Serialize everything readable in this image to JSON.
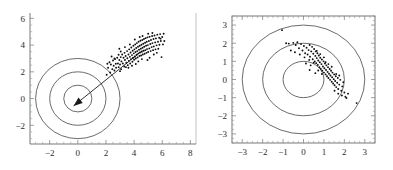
{
  "figure": {
    "title": "",
    "background": "#ffffff",
    "point_color": "#0d0d0d",
    "ring_color": "#3a3a3a",
    "axis_color": "#555555"
  },
  "chart_data": [
    {
      "type": "scatter",
      "panel": "left",
      "title": "",
      "xlabel": "",
      "ylabel": "",
      "xlim": [
        -3.4,
        8.4
      ],
      "ylim": [
        -3.4,
        6.4
      ],
      "xticks": [
        -2,
        0,
        2,
        4,
        6,
        8
      ],
      "xtick_labels": [
        "-2",
        "0",
        "2",
        "4",
        "6",
        "8"
      ],
      "yticks": [
        -2,
        0,
        2,
        4,
        6
      ],
      "ytick_labels": [
        "-2",
        "0",
        "2",
        "4",
        "6"
      ],
      "grid": false,
      "legend": null,
      "axes_style": "L-shaped spines with minor ticks",
      "annotations": [
        {
          "kind": "circle",
          "label": "unit-circle",
          "center": [
            0,
            0
          ],
          "radius": 1
        },
        {
          "kind": "circle",
          "label": "radius-2-circle",
          "center": [
            0,
            0
          ],
          "radius": 2
        },
        {
          "kind": "circle",
          "label": "radius-3-circle",
          "center": [
            0,
            0
          ],
          "radius": 3
        },
        {
          "kind": "arrow",
          "label": "mean-direction-arrow",
          "from": [
            4.6,
            3.6
          ],
          "to": [
            -0.3,
            -0.55
          ]
        }
      ],
      "points": [
        [
          2.05,
          1.78
        ],
        [
          2.15,
          2.3
        ],
        [
          2.3,
          1.95
        ],
        [
          2.35,
          2.55
        ],
        [
          2.45,
          2.2
        ],
        [
          2.5,
          2.85
        ],
        [
          2.55,
          2.45
        ],
        [
          2.6,
          2.1
        ],
        [
          2.65,
          2.95
        ],
        [
          2.7,
          2.6
        ],
        [
          2.72,
          2.3
        ],
        [
          2.8,
          3.05
        ],
        [
          2.85,
          2.62
        ],
        [
          2.9,
          2.35
        ],
        [
          2.95,
          2.88
        ],
        [
          3.0,
          2.55
        ],
        [
          3.05,
          3.1
        ],
        [
          3.08,
          2.2
        ],
        [
          3.1,
          2.78
        ],
        [
          3.15,
          3.3
        ],
        [
          3.2,
          2.62
        ],
        [
          3.25,
          3.05
        ],
        [
          3.3,
          2.4
        ],
        [
          3.32,
          3.42
        ],
        [
          3.35,
          2.88
        ],
        [
          3.4,
          3.18
        ],
        [
          3.45,
          2.68
        ],
        [
          3.5,
          3.55
        ],
        [
          3.52,
          3.02
        ],
        [
          3.55,
          2.5
        ],
        [
          3.6,
          3.3
        ],
        [
          3.62,
          2.82
        ],
        [
          3.65,
          3.68
        ],
        [
          3.7,
          3.12
        ],
        [
          3.72,
          2.62
        ],
        [
          3.75,
          3.45
        ],
        [
          3.78,
          2.95
        ],
        [
          3.8,
          3.82
        ],
        [
          3.85,
          3.25
        ],
        [
          3.88,
          2.75
        ],
        [
          3.9,
          3.58
        ],
        [
          3.92,
          3.05
        ],
        [
          3.95,
          3.95
        ],
        [
          3.98,
          3.38
        ],
        [
          4.0,
          2.9
        ],
        [
          4.02,
          3.68
        ],
        [
          4.05,
          3.15
        ],
        [
          4.08,
          4.05
        ],
        [
          4.1,
          3.48
        ],
        [
          4.12,
          3.0
        ],
        [
          4.15,
          3.78
        ],
        [
          4.18,
          3.28
        ],
        [
          4.2,
          4.15
        ],
        [
          4.22,
          3.55
        ],
        [
          4.25,
          3.08
        ],
        [
          4.28,
          3.88
        ],
        [
          4.3,
          3.38
        ],
        [
          4.32,
          4.25
        ],
        [
          4.35,
          3.65
        ],
        [
          4.38,
          3.18
        ],
        [
          4.4,
          3.95
        ],
        [
          4.42,
          3.45
        ],
        [
          4.45,
          4.32
        ],
        [
          4.48,
          3.72
        ],
        [
          4.5,
          3.22
        ],
        [
          4.52,
          4.02
        ],
        [
          4.55,
          3.5
        ],
        [
          4.58,
          4.38
        ],
        [
          4.6,
          3.8
        ],
        [
          4.62,
          3.3
        ],
        [
          4.65,
          4.1
        ],
        [
          4.68,
          3.58
        ],
        [
          4.7,
          4.45
        ],
        [
          4.72,
          3.88
        ],
        [
          4.75,
          3.35
        ],
        [
          4.78,
          4.18
        ],
        [
          4.8,
          3.62
        ],
        [
          4.82,
          4.52
        ],
        [
          4.85,
          3.95
        ],
        [
          4.88,
          3.42
        ],
        [
          4.9,
          4.25
        ],
        [
          4.92,
          3.7
        ],
        [
          4.95,
          4.58
        ],
        [
          4.98,
          4.0
        ],
        [
          5.0,
          3.48
        ],
        [
          5.05,
          4.3
        ],
        [
          5.08,
          3.75
        ],
        [
          5.1,
          4.62
        ],
        [
          5.15,
          4.08
        ],
        [
          5.18,
          3.55
        ],
        [
          5.2,
          4.38
        ],
        [
          5.25,
          3.85
        ],
        [
          5.28,
          4.68
        ],
        [
          5.3,
          4.15
        ],
        [
          5.35,
          3.62
        ],
        [
          5.38,
          4.45
        ],
        [
          5.4,
          3.9
        ],
        [
          5.45,
          4.72
        ],
        [
          5.5,
          4.2
        ],
        [
          5.52,
          3.68
        ],
        [
          5.55,
          4.5
        ],
        [
          5.6,
          3.98
        ],
        [
          5.65,
          4.78
        ],
        [
          5.7,
          4.25
        ],
        [
          5.72,
          3.72
        ],
        [
          5.78,
          4.55
        ],
        [
          5.8,
          4.02
        ],
        [
          5.85,
          4.82
        ],
        [
          5.9,
          4.3
        ],
        [
          5.95,
          3.1
        ],
        [
          6.0,
          4.6
        ],
        [
          6.05,
          4.05
        ],
        [
          6.1,
          4.85
        ],
        [
          2.25,
          2.72
        ],
        [
          2.6,
          3.0
        ],
        [
          3.0,
          2.05
        ],
        [
          3.42,
          2.35
        ],
        [
          3.05,
          3.52
        ],
        [
          4.3,
          2.78
        ],
        [
          4.55,
          2.95
        ],
        [
          5.1,
          3.05
        ],
        [
          5.4,
          3.3
        ],
        [
          4.95,
          2.88
        ],
        [
          3.85,
          2.45
        ],
        [
          2.9,
          3.28
        ],
        [
          3.6,
          2.3
        ],
        [
          4.12,
          2.58
        ],
        [
          5.62,
          3.42
        ],
        [
          5.88,
          4.48
        ],
        [
          6.15,
          4.3
        ],
        [
          4.4,
          4.6
        ],
        [
          4.05,
          4.42
        ],
        [
          3.7,
          4.05
        ],
        [
          3.35,
          3.85
        ],
        [
          2.95,
          3.72
        ],
        [
          5.0,
          4.85
        ],
        [
          5.3,
          4.9
        ],
        [
          4.6,
          4.68
        ],
        [
          2.4,
          3.15
        ],
        [
          2.1,
          2.6
        ]
      ]
    },
    {
      "type": "scatter",
      "panel": "right",
      "title": "",
      "xlabel": "",
      "ylabel": "",
      "xlim": [
        -3.5,
        3.5
      ],
      "ylim": [
        -3.5,
        3.5
      ],
      "xticks": [
        -3,
        -2,
        -1,
        0,
        1,
        2,
        3
      ],
      "xtick_labels": [
        "-3",
        "-2",
        "-1",
        "0",
        "1",
        "2",
        "3"
      ],
      "yticks": [
        -3,
        -2,
        -1,
        0,
        1,
        2,
        3
      ],
      "ytick_labels": [
        "-3",
        "-2",
        "-1",
        "0",
        "1",
        "2",
        "3"
      ],
      "grid": false,
      "legend": null,
      "axes_style": "full box frame with minor ticks",
      "annotations": [
        {
          "kind": "circle",
          "label": "unit-circle",
          "center": [
            0,
            0
          ],
          "radius": 1
        },
        {
          "kind": "circle",
          "label": "radius-2-circle",
          "center": [
            0,
            0
          ],
          "radius": 2
        },
        {
          "kind": "circle",
          "label": "radius-3-circle",
          "center": [
            0,
            0
          ],
          "radius": 3
        }
      ],
      "points": [
        [
          -1.05,
          2.72
        ],
        [
          -0.85,
          2.0
        ],
        [
          -0.72,
          1.98
        ],
        [
          -0.5,
          2.02
        ],
        [
          -0.38,
          1.9
        ],
        [
          -0.3,
          2.05
        ],
        [
          -0.22,
          1.72
        ],
        [
          -0.12,
          1.95
        ],
        [
          -0.05,
          1.6
        ],
        [
          0.02,
          1.85
        ],
        [
          0.08,
          1.45
        ],
        [
          0.15,
          1.75
        ],
        [
          0.2,
          1.38
        ],
        [
          0.25,
          1.62
        ],
        [
          0.3,
          1.9
        ],
        [
          0.32,
          1.25
        ],
        [
          0.38,
          1.55
        ],
        [
          0.42,
          1.8
        ],
        [
          0.45,
          1.12
        ],
        [
          0.48,
          1.42
        ],
        [
          0.52,
          1.68
        ],
        [
          0.55,
          1.0
        ],
        [
          0.58,
          1.3
        ],
        [
          0.6,
          1.55
        ],
        [
          0.62,
          0.9
        ],
        [
          0.65,
          1.18
        ],
        [
          0.68,
          1.45
        ],
        [
          0.7,
          0.8
        ],
        [
          0.72,
          1.05
        ],
        [
          0.75,
          1.32
        ],
        [
          0.78,
          0.68
        ],
        [
          0.8,
          0.95
        ],
        [
          0.82,
          1.2
        ],
        [
          0.85,
          0.58
        ],
        [
          0.88,
          0.85
        ],
        [
          0.9,
          1.1
        ],
        [
          0.92,
          0.48
        ],
        [
          0.95,
          0.72
        ],
        [
          0.98,
          1.0
        ],
        [
          1.0,
          0.38
        ],
        [
          1.02,
          0.62
        ],
        [
          1.05,
          0.88
        ],
        [
          1.08,
          0.28
        ],
        [
          1.1,
          0.52
        ],
        [
          1.12,
          0.78
        ],
        [
          1.15,
          0.18
        ],
        [
          1.18,
          0.42
        ],
        [
          1.2,
          0.68
        ],
        [
          1.22,
          0.08
        ],
        [
          1.25,
          0.32
        ],
        [
          1.28,
          0.58
        ],
        [
          1.3,
          -0.02
        ],
        [
          1.32,
          0.22
        ],
        [
          1.35,
          0.48
        ],
        [
          1.38,
          -0.12
        ],
        [
          1.4,
          0.12
        ],
        [
          1.42,
          0.38
        ],
        [
          1.45,
          -0.22
        ],
        [
          1.48,
          0.02
        ],
        [
          1.5,
          0.28
        ],
        [
          1.52,
          -0.32
        ],
        [
          1.55,
          -0.08
        ],
        [
          1.58,
          0.18
        ],
        [
          1.6,
          -0.42
        ],
        [
          1.65,
          -0.18
        ],
        [
          1.68,
          0.08
        ],
        [
          1.7,
          -0.52
        ],
        [
          1.75,
          -0.28
        ],
        [
          1.8,
          -0.02
        ],
        [
          1.85,
          -0.62
        ],
        [
          1.9,
          -0.38
        ],
        [
          1.95,
          -0.15
        ],
        [
          2.0,
          -0.72
        ],
        [
          2.05,
          -0.95
        ],
        [
          2.1,
          -1.02
        ],
        [
          2.6,
          -1.3
        ],
        [
          -0.62,
          1.6
        ],
        [
          -0.42,
          1.5
        ],
        [
          -0.18,
          1.38
        ],
        [
          0.05,
          1.22
        ],
        [
          0.28,
          1.08
        ],
        [
          0.5,
          0.92
        ],
        [
          0.72,
          0.5
        ],
        [
          0.9,
          0.3
        ],
        [
          1.08,
          0.95
        ],
        [
          0.35,
          0.78
        ],
        [
          0.58,
          0.35
        ],
        [
          0.3,
          0.52
        ],
        [
          0.12,
          0.88
        ],
        [
          1.38,
          0.7
        ],
        [
          1.22,
          0.85
        ],
        [
          1.0,
          1.22
        ],
        [
          0.82,
          1.4
        ],
        [
          0.65,
          1.58
        ],
        [
          1.6,
          0.3
        ],
        [
          1.75,
          0.22
        ],
        [
          1.52,
          -0.62
        ],
        [
          1.7,
          -0.78
        ],
        [
          1.88,
          -0.88
        ],
        [
          2.18,
          -0.78
        ]
      ]
    }
  ]
}
